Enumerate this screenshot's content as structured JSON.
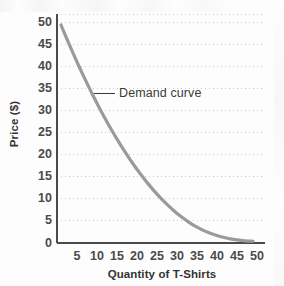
{
  "chart_data": {
    "type": "line",
    "title": "",
    "xlabel": "Quantity of T-Shirts",
    "ylabel": "Price ($)",
    "xlim": [
      0,
      52
    ],
    "ylim": [
      0,
      52
    ],
    "xticks": [
      5,
      10,
      15,
      20,
      25,
      30,
      35,
      40,
      45,
      50
    ],
    "yticks": [
      0,
      5,
      10,
      15,
      20,
      25,
      30,
      35,
      40,
      45,
      50
    ],
    "grid": "horizontal-dotted",
    "legend": "none",
    "series": [
      {
        "name": "Demand curve",
        "color": "#9a9a9a",
        "x": [
          1,
          3,
          5,
          7,
          9,
          11,
          13,
          15,
          17,
          19,
          21,
          23,
          25,
          27,
          29,
          31,
          33,
          35,
          37,
          39,
          41,
          43,
          45,
          47,
          49
        ],
        "y": [
          49.5,
          45.2,
          41.1,
          37.2,
          33.5,
          30.0,
          26.7,
          23.6,
          20.7,
          18.0,
          15.5,
          13.2,
          11.1,
          9.2,
          7.5,
          6.0,
          4.7,
          3.6,
          2.7,
          2.0,
          1.4,
          1.0,
          0.7,
          0.5,
          0.4
        ]
      }
    ],
    "annotations": [
      {
        "text": "Demand curve",
        "leader_line": true,
        "points_to_x": 9,
        "points_to_y": 34
      }
    ]
  },
  "axes": {
    "y_tick_labels": [
      "50",
      "45",
      "40",
      "35",
      "30",
      "25",
      "20",
      "15",
      "10",
      "5",
      "0"
    ],
    "x_tick_labels": [
      "5",
      "10",
      "15",
      "20",
      "25",
      "30",
      "35",
      "40",
      "45",
      "50"
    ],
    "y_title": "Price ($)",
    "x_title": "Quantity of T-Shirts"
  },
  "annotation": {
    "demand_curve_label": "Demand curve"
  },
  "colors": {
    "curve": "#9a9a9a",
    "axis": "#4a4a4a",
    "gridline": "#c9c9d4",
    "tick_text": "#4a4a4a",
    "title_text": "#333333",
    "background": "#fdfdfd"
  }
}
